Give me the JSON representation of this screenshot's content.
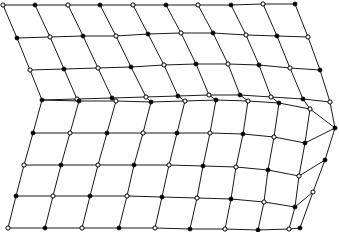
{
  "figure": {
    "background_color": "#ffffff",
    "line_color": "#1a1a1a",
    "node_open_fill": "#ffffff",
    "node_filled_fill": "#000000",
    "node_stroke_color": "#000000",
    "line_width": 1.0,
    "node_radius": 2.1,
    "width": 339,
    "height": 232
  },
  "mesh_data": {
    "type": "quad-mesh",
    "rows_of_nodes": 9,
    "cols_of_nodes": 10,
    "cells": 72,
    "fold_row_index": 4,
    "marker_pattern": "checkerboard-open-filled",
    "left_fold_vertex": [
      42,
      100
    ],
    "right_fold_vertex": [
      335,
      128
    ],
    "nodes": [
      [
        [
          3,
          5
        ],
        [
          35,
          5
        ],
        [
          68,
          5
        ],
        [
          100,
          5
        ],
        [
          133,
          5
        ],
        [
          166,
          5
        ],
        [
          198,
          5
        ],
        [
          231,
          5
        ],
        [
          263,
          4
        ],
        [
          295,
          4
        ]
      ],
      [
        [
          17,
          38
        ],
        [
          50,
          37
        ],
        [
          83,
          36
        ],
        [
          116,
          36
        ],
        [
          148,
          34
        ],
        [
          181,
          33
        ],
        [
          213,
          33
        ],
        [
          246,
          35
        ],
        [
          277,
          36
        ],
        [
          308,
          37
        ]
      ],
      [
        [
          30,
          70
        ],
        [
          64,
          69
        ],
        [
          98,
          68
        ],
        [
          131,
          67
        ],
        [
          164,
          65
        ],
        [
          196,
          64
        ],
        [
          228,
          64
        ],
        [
          259,
          65
        ],
        [
          290,
          68
        ],
        [
          320,
          70
        ]
      ],
      [
        [
          42,
          100
        ],
        [
          77,
          99
        ],
        [
          112,
          98
        ],
        [
          146,
          97
        ],
        [
          178,
          96
        ],
        [
          209,
          95
        ],
        [
          240,
          95
        ],
        [
          271,
          97
        ],
        [
          303,
          99
        ],
        [
          330,
          102
        ]
      ],
      [
        [
          42,
          100
        ],
        [
          79,
          101
        ],
        [
          116,
          101
        ],
        [
          151,
          102
        ],
        [
          185,
          101
        ],
        [
          216,
          100
        ],
        [
          248,
          101
        ],
        [
          279,
          103
        ],
        [
          310,
          109
        ],
        [
          335,
          128
        ]
      ],
      [
        [
          33,
          133
        ],
        [
          70,
          133
        ],
        [
          107,
          133
        ],
        [
          143,
          133
        ],
        [
          177,
          133
        ],
        [
          210,
          133
        ],
        [
          243,
          134
        ],
        [
          274,
          137
        ],
        [
          305,
          143
        ],
        [
          335,
          128
        ]
      ],
      [
        [
          24,
          165
        ],
        [
          61,
          165
        ],
        [
          98,
          165
        ],
        [
          134,
          165
        ],
        [
          169,
          165
        ],
        [
          203,
          166
        ],
        [
          236,
          167
        ],
        [
          268,
          170
        ],
        [
          299,
          176
        ],
        [
          325,
          160
        ]
      ],
      [
        [
          16,
          196
        ],
        [
          53,
          196
        ],
        [
          90,
          196
        ],
        [
          127,
          196
        ],
        [
          162,
          197
        ],
        [
          197,
          198
        ],
        [
          231,
          199
        ],
        [
          264,
          202
        ],
        [
          295,
          207
        ],
        [
          313,
          192
        ]
      ],
      [
        [
          8,
          228
        ],
        [
          45,
          228
        ],
        [
          82,
          228
        ],
        [
          119,
          228
        ],
        [
          155,
          228
        ],
        [
          190,
          229
        ],
        [
          225,
          229
        ],
        [
          258,
          230
        ],
        [
          289,
          229
        ],
        [
          300,
          228
        ]
      ]
    ]
  }
}
